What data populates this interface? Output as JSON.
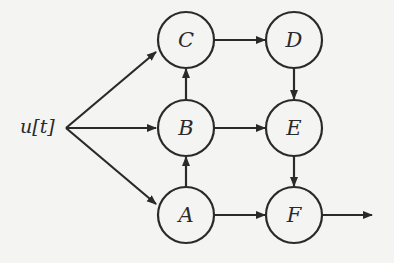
{
  "diagram": {
    "type": "block-diagram",
    "input": {
      "label": "u[t]"
    },
    "nodes": [
      {
        "id": "C",
        "label": "C",
        "cx": 186,
        "cy": 40
      },
      {
        "id": "D",
        "label": "D",
        "cx": 294,
        "cy": 40
      },
      {
        "id": "B",
        "label": "B",
        "cx": 186,
        "cy": 128
      },
      {
        "id": "E",
        "label": "E",
        "cx": 294,
        "cy": 128
      },
      {
        "id": "A",
        "label": "A",
        "cx": 186,
        "cy": 215
      },
      {
        "id": "F",
        "label": "F",
        "cx": 294,
        "cy": 215
      }
    ],
    "edges": [
      {
        "from": "u[t]",
        "to": "C"
      },
      {
        "from": "u[t]",
        "to": "B"
      },
      {
        "from": "u[t]",
        "to": "A"
      },
      {
        "from": "A",
        "to": "B"
      },
      {
        "from": "B",
        "to": "C"
      },
      {
        "from": "C",
        "to": "D"
      },
      {
        "from": "B",
        "to": "E"
      },
      {
        "from": "A",
        "to": "F"
      },
      {
        "from": "D",
        "to": "E"
      },
      {
        "from": "E",
        "to": "F"
      },
      {
        "from": "F",
        "to": "output"
      }
    ],
    "colors": {
      "stroke": "#2a2a2a",
      "background": "#f4f4f2"
    }
  }
}
